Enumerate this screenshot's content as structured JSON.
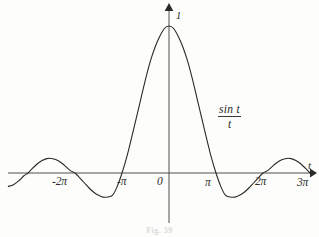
{
  "figure": {
    "caption": "Fig. 39",
    "background_color": "#fdfdfb",
    "ink_color": "#2a2a2a"
  },
  "labels": {
    "y_peak": "1",
    "axis_t": "t",
    "function_numerator": "sin t",
    "function_denominator": "t"
  },
  "chart_data": {
    "type": "line",
    "title": "",
    "subtitle": "",
    "xlabel": "t",
    "ylabel": "",
    "annotations": [
      {
        "text": "sin t / t",
        "x": 4.7,
        "y": 0.46,
        "style": "fraction"
      },
      {
        "text": "1",
        "x": 0.22,
        "y": 1.02,
        "style": "italic"
      }
    ],
    "legend": [],
    "legend_position": "none",
    "grid": false,
    "xlim": [
      -3.42,
      3.1
    ],
    "ylim": [
      -0.34,
      1.15
    ],
    "xlim_units": "pi",
    "ylim_units": "value",
    "xticks": [
      -2,
      -1,
      0,
      1,
      2,
      3
    ],
    "xtick_labels": [
      "-2π",
      "-π",
      "0",
      "π",
      "2π",
      "3π"
    ],
    "xtick_units": "pi",
    "yticks": [
      1
    ],
    "ytick_labels": [
      "1"
    ],
    "axis_arrows": {
      "x_right": true,
      "y_up": true
    },
    "series": [
      {
        "name": "sin t / t",
        "color": "#2a2a2a",
        "linewidth": 1.1,
        "formula": "sin(t)/t",
        "x": [
          -10.74,
          -10.4,
          -10.05,
          -9.7,
          -9.42,
          -9.11,
          -8.8,
          -8.48,
          -8.17,
          -7.85,
          -7.54,
          -7.23,
          -6.91,
          -6.6,
          -6.28,
          -5.97,
          -5.65,
          -5.34,
          -5.03,
          -4.71,
          -4.4,
          -4.08,
          -3.77,
          -3.46,
          -3.14,
          -2.83,
          -2.51,
          -2.2,
          -1.88,
          -1.57,
          -1.26,
          -0.94,
          -0.63,
          -0.31,
          0.0,
          0.31,
          0.63,
          0.94,
          1.26,
          1.57,
          1.88,
          2.2,
          2.51,
          2.83,
          3.14,
          3.46,
          3.77,
          4.08,
          4.4,
          4.71,
          5.03,
          5.34,
          5.65,
          5.97,
          6.28,
          6.6,
          6.91,
          7.23,
          7.54,
          7.85,
          8.17,
          8.48,
          8.8,
          9.11,
          9.42,
          9.74
        ],
        "y": [
          -0.091,
          -0.08,
          -0.054,
          -0.019,
          0.0,
          0.033,
          0.063,
          0.085,
          0.098,
          0.099,
          0.09,
          0.071,
          0.045,
          0.016,
          0.0,
          -0.033,
          -0.068,
          -0.102,
          -0.131,
          -0.152,
          -0.164,
          -0.163,
          -0.151,
          -0.091,
          0.0,
          0.106,
          0.236,
          0.368,
          0.505,
          0.637,
          0.756,
          0.854,
          0.927,
          0.983,
          1.0,
          0.983,
          0.927,
          0.854,
          0.756,
          0.637,
          0.505,
          0.368,
          0.236,
          0.106,
          0.0,
          -0.091,
          -0.151,
          -0.163,
          -0.164,
          -0.152,
          -0.131,
          -0.102,
          -0.068,
          -0.033,
          0.0,
          0.016,
          0.045,
          0.071,
          0.09,
          0.099,
          0.098,
          0.085,
          0.063,
          0.033,
          0.0,
          -0.026
        ]
      }
    ]
  }
}
